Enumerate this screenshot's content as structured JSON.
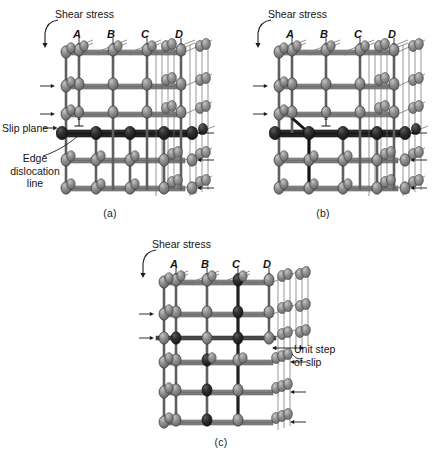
{
  "figure": {
    "type": "scientific-diagram",
    "background_color": "#ffffff",
    "ink_color": "#1a1a1a",
    "atom_fill": "#8a8a8a",
    "atom_fill_dark": "#2b2b2b",
    "atom_stroke": "#3a3a3a",
    "bond_color": "#595959",
    "bond_color_dark": "#1c1c1c"
  },
  "panels": [
    {
      "id": "a",
      "caption": "(a)",
      "stage": "Dislocation at column A; extra half-plane terminates above slip plane",
      "shear_label": "Shear stress",
      "column_labels": [
        "A",
        "B",
        "C",
        "D"
      ],
      "annotations": [
        {
          "name": "slip-plane",
          "text": "Slip plane"
        },
        {
          "name": "edge-dislocation-line",
          "text": "Edge\ndislocation\nline"
        }
      ],
      "dislocation_column": "A",
      "lattice": {
        "columns": 5,
        "rows": 6,
        "slip_plane_row": 3
      }
    },
    {
      "id": "b",
      "caption": "(b)",
      "stage": "Dislocation has glided one atomic spacing to column B",
      "shear_label": "Shear stress",
      "column_labels": [
        "A",
        "B",
        "C",
        "D"
      ],
      "annotations": [],
      "dislocation_column": "B",
      "lattice": {
        "columns": 5,
        "rows": 6,
        "slip_plane_row": 3
      }
    },
    {
      "id": "c",
      "caption": "(c)",
      "stage": "Dislocation has exited the crystal leaving a unit step of slip at the surface",
      "shear_label": "Shear stress",
      "column_labels": [
        "A",
        "B",
        "C",
        "D"
      ],
      "annotations": [
        {
          "name": "unit-step-of-slip",
          "text": "Unit step\nof slip"
        }
      ],
      "dislocation_column": null,
      "lattice": {
        "columns": 5,
        "rows": 6,
        "slip_plane_row": 2
      }
    }
  ],
  "symbols": {
    "dislocation_symbol": "⊥",
    "shear_arrow_top": "down-arrow",
    "shear_arrow_left": "right-arrow",
    "shear_arrow_right": "left-arrow"
  }
}
